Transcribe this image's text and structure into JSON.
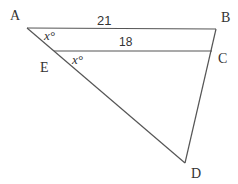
{
  "diagram": {
    "vertices": {
      "A": {
        "label": "A",
        "x": 27,
        "y": 28
      },
      "B": {
        "label": "B",
        "x": 216,
        "y": 29
      },
      "C": {
        "label": "C",
        "x": 212,
        "y": 51
      },
      "E": {
        "label": "E",
        "x": 54,
        "y": 51
      },
      "D": {
        "label": "D",
        "x": 185,
        "y": 163
      }
    },
    "segments": [
      {
        "from": "A",
        "to": "B",
        "label": "21"
      },
      {
        "from": "E",
        "to": "C",
        "label": "18"
      },
      {
        "from": "A",
        "to": "D"
      },
      {
        "from": "B",
        "to": "D"
      }
    ],
    "angle_labels": [
      {
        "at": "A",
        "text": "x°"
      },
      {
        "at": "E",
        "text": "x°"
      }
    ],
    "stroke_color": "#555555"
  }
}
